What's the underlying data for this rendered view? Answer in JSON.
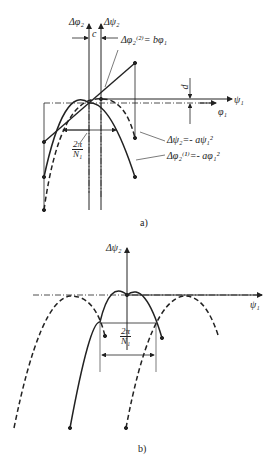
{
  "figure_a": {
    "caption": "a)",
    "axis_labels": {
      "y_left": "Δφ₂",
      "y_right": "Δψ₂",
      "x_upper": "ψ₁",
      "x_lower": "φ₁"
    },
    "dimension_labels": {
      "c": "c",
      "d": "d",
      "period_num": "2π",
      "period_den": "N₁"
    },
    "curve_labels": {
      "line": "Δφ₂⁽²⁾= bφ₁",
      "dashed_parabola": "Δψ₂=- aψ₁²",
      "solid_parabola": "Δφ₂⁽¹⁾=- aφ₁²"
    }
  },
  "figure_b": {
    "caption": "b)",
    "axis_labels": {
      "y": "Δψ₂",
      "x": "ψ₁"
    },
    "dimension_labels": {
      "period_num": "2π",
      "period_den": "N₁"
    }
  }
}
